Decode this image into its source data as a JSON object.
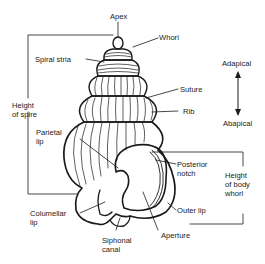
{
  "figure": {
    "labels": {
      "apex": "Apex",
      "whorl": "Whorl",
      "spiral_stria": "Spiral stria",
      "suture": "Suture",
      "rib": "Rib",
      "height_of_spire": "Height\nof spire",
      "parietal_lip": "Parietal\nlip",
      "posterior_notch": "Posterior\nnotch",
      "height_of_body_whorl": "Height\nof body\nwhorl",
      "outer_lip": "Outer lip",
      "columellar_lip": "Columellar\nlip",
      "aperture": "Aperture",
      "siphonal_canal": "Siphonal\ncanal"
    },
    "orientation": {
      "top": "Adapical",
      "bottom": "Abapical"
    },
    "colors": {
      "line": "#1a1a1a",
      "background": "#ffffff"
    }
  }
}
